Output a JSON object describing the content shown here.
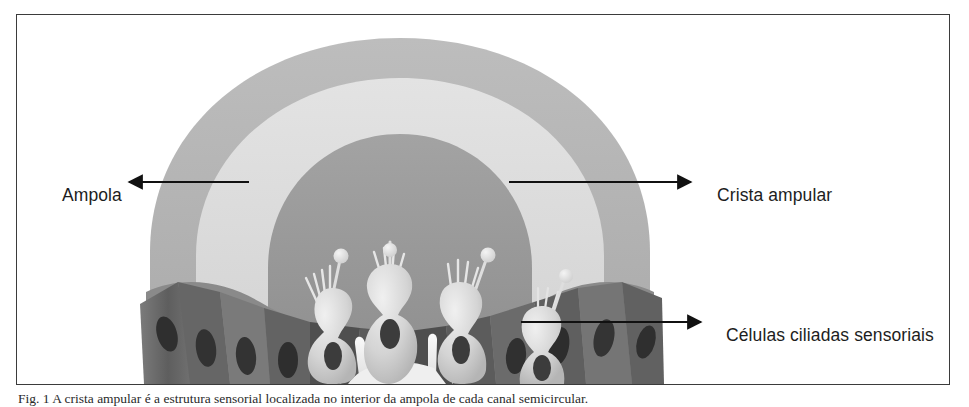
{
  "figure": {
    "callouts": [
      {
        "id": "ampola",
        "label": "Ampola",
        "arrow_direction": "left",
        "arrow_from_x": 248,
        "arrow_to_x": 126,
        "arrow_y": 181
      },
      {
        "id": "crista-ampular",
        "label": "Crista ampular",
        "arrow_direction": "right",
        "arrow_from_x": 508,
        "arrow_to_x": 690,
        "arrow_y": 181
      },
      {
        "id": "celulas-ciliadas-sensoriais",
        "label": "Células ciliadas sensoriais",
        "arrow_direction": "right",
        "arrow_from_x": 520,
        "arrow_to_x": 700,
        "arrow_y": 321
      }
    ],
    "caption": "Fig. 1  A crista ampular é a estrutura sensorial localizada no interior da ampola de cada canal semicircular.",
    "colors": {
      "frame_border": "#3b3b3b",
      "text": "#1d1d1d",
      "arrow": "#111111",
      "dome_outer": "#b4b4b4",
      "dome_middle": "#dcdcdc",
      "dome_inner": "#9a9a9a",
      "supporting_cell_dark": "#6e6e6e",
      "supporting_cell_shadow": "#4a4a4a",
      "hair_cell_light": "#d6d6d6",
      "hair_cell_highlight": "#ececec",
      "nucleus_dark": "#3a3a3a",
      "kinocilium_bulb": "#e2e2e2",
      "nerve_white": "#f2f2f2",
      "background": "#ffffff"
    }
  }
}
